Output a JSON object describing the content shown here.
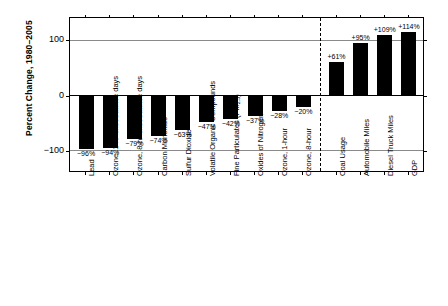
{
  "chart_data": {
    "type": "bar",
    "title": "",
    "subtitle": "",
    "xlabel": "",
    "ylabel": "Percent Change, 1980–2005",
    "ylim": [
      -140,
      140
    ],
    "yticks": [
      100,
      0,
      -100
    ],
    "ytick_labels": [
      "100",
      "0",
      "−100"
    ],
    "grid": true,
    "gridlines_at": [
      100,
      -100
    ],
    "zero_line": true,
    "legend": "none",
    "divider_after_index": 9,
    "divider_style": "dashed",
    "bar_color": "#000000",
    "categories": [
      "Lead",
      "Ozone, 1-hr exceedance days",
      "Ozone, 8-hr exceedance days",
      "Carbon Monoxide",
      "Sulfur Dioxide",
      "Volatile Organic Compounds",
      "Fine Particulates (PM2.5)",
      "Oxides of Nitrogen",
      "Ozone, 1-hour",
      "Ozone, 8-hour",
      "Coal Usage",
      "Automobile Miles",
      "Diesel Truck Miles",
      "GDP"
    ],
    "category_labels_html": [
      "Lead",
      "Ozone, 1-hr exceedance days",
      "Ozone, 8-hr exceedance days",
      "Carbon Monoxide",
      "Sulfur Dioxide",
      "Volatile Organic Compounds",
      "Fine Particulates (PM<sub>2.5</sub>)",
      "Oxides of Nitrogen",
      "Ozone, 1-hour",
      "Ozone, 8-hour",
      "Coal Usage",
      "Automobile Miles",
      "Diesel Truck Miles",
      "GDP"
    ],
    "values": [
      -96,
      -94,
      -79,
      -74,
      -63,
      -47,
      -42,
      -37,
      -28,
      -20,
      61,
      95,
      109,
      114
    ],
    "value_labels": [
      "−96%",
      "−94%",
      "−79%",
      "−74%",
      "−63%",
      "−47%",
      "−42%",
      "−37%",
      "−28%",
      "−20%",
      "+61%",
      "+95%",
      "+109%",
      "+114%"
    ]
  }
}
